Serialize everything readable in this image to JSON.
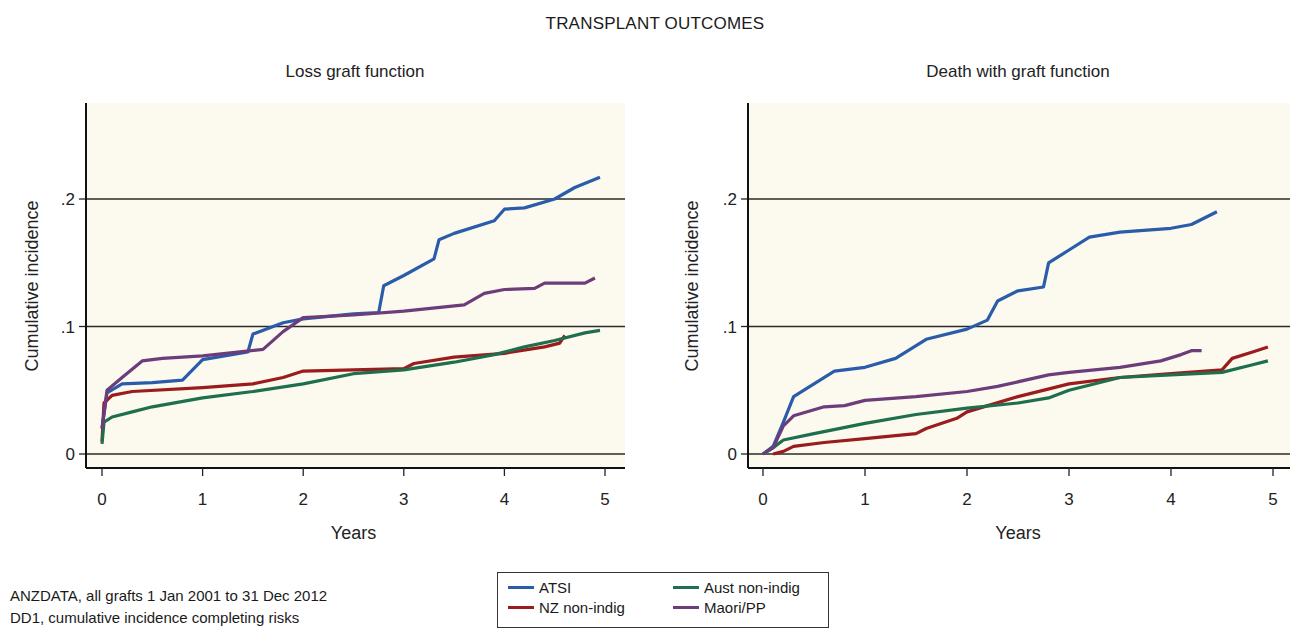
{
  "title": "TRANSPLANT OUTCOMES",
  "caption": {
    "line1": "ANZDATA, all grafts 1 Jan 2001 to 31 Dec 2012",
    "line2": "DD1, cumulative incidence completing risks"
  },
  "legend": [
    {
      "name": "ATSI",
      "color": "#2a5caa"
    },
    {
      "name": "NZ non-indig",
      "color": "#9b1c1c"
    },
    {
      "name": "Aust non-indig",
      "color": "#1f6e4e"
    },
    {
      "name": "Maori/PP",
      "color": "#6c3d7a"
    }
  ],
  "chart_data": [
    {
      "type": "line",
      "title": "Loss graft function",
      "xlabel": "Years",
      "ylabel": "Cumulative incidence",
      "xlim": [
        0,
        5
      ],
      "ylim": [
        0,
        0.25
      ],
      "xticks": [
        "0",
        "1",
        "2",
        "3",
        "4",
        "5"
      ],
      "yticks": [
        "0",
        ".1",
        ".2"
      ],
      "grid": "horizontal at y ticks",
      "series": [
        {
          "name": "ATSI",
          "color": "#2a5caa",
          "x": [
            0,
            0.05,
            0.2,
            0.5,
            0.8,
            1.0,
            1.45,
            1.5,
            1.8,
            2.0,
            2.5,
            2.75,
            2.8,
            3.0,
            3.3,
            3.35,
            3.5,
            3.9,
            4.0,
            4.2,
            4.5,
            4.7,
            4.95
          ],
          "y": [
            0.02,
            0.048,
            0.055,
            0.056,
            0.058,
            0.074,
            0.08,
            0.094,
            0.103,
            0.106,
            0.11,
            0.111,
            0.132,
            0.14,
            0.153,
            0.168,
            0.173,
            0.183,
            0.192,
            0.193,
            0.2,
            0.209,
            0.217
          ]
        },
        {
          "name": "NZ non-indig",
          "color": "#9b1c1c",
          "x": [
            0,
            0.02,
            0.1,
            0.3,
            1.0,
            1.5,
            1.8,
            2.0,
            2.5,
            3.0,
            3.1,
            3.5,
            4.0,
            4.4,
            4.55,
            4.6
          ],
          "y": [
            0.01,
            0.04,
            0.046,
            0.049,
            0.052,
            0.055,
            0.06,
            0.065,
            0.066,
            0.067,
            0.071,
            0.076,
            0.079,
            0.084,
            0.087,
            0.093
          ]
        },
        {
          "name": "Aust non-indig",
          "color": "#1f6e4e",
          "x": [
            0,
            0.02,
            0.1,
            0.3,
            0.5,
            1.0,
            1.5,
            2.0,
            2.5,
            3.0,
            3.5,
            3.9,
            4.2,
            4.5,
            4.8,
            4.95
          ],
          "y": [
            0.008,
            0.025,
            0.029,
            0.033,
            0.037,
            0.044,
            0.049,
            0.055,
            0.063,
            0.066,
            0.072,
            0.078,
            0.084,
            0.089,
            0.095,
            0.097
          ]
        },
        {
          "name": "Maori/PP",
          "color": "#6c3d7a",
          "x": [
            0,
            0.05,
            0.2,
            0.4,
            0.6,
            1.0,
            1.6,
            1.8,
            2.0,
            2.5,
            3.0,
            3.6,
            3.8,
            4.0,
            4.3,
            4.4,
            4.8,
            4.9
          ],
          "y": [
            0.02,
            0.05,
            0.06,
            0.073,
            0.075,
            0.077,
            0.082,
            0.096,
            0.107,
            0.109,
            0.112,
            0.117,
            0.126,
            0.129,
            0.13,
            0.134,
            0.134,
            0.138
          ]
        }
      ]
    },
    {
      "type": "line",
      "title": "Death with graft function",
      "xlabel": "Years",
      "ylabel": "Cumulative incidence",
      "xlim": [
        0,
        5
      ],
      "ylim": [
        0,
        0.25
      ],
      "xticks": [
        "0",
        "1",
        "2",
        "3",
        "4",
        "5"
      ],
      "yticks": [
        "0",
        ".1",
        ".2"
      ],
      "grid": "horizontal at y ticks",
      "series": [
        {
          "name": "ATSI",
          "color": "#2a5caa",
          "x": [
            0,
            0.1,
            0.2,
            0.3,
            0.5,
            0.7,
            1.0,
            1.3,
            1.6,
            2.0,
            2.2,
            2.3,
            2.5,
            2.75,
            2.8,
            3.0,
            3.2,
            3.5,
            4.0,
            4.2,
            4.45
          ],
          "y": [
            0,
            0.006,
            0.025,
            0.045,
            0.055,
            0.065,
            0.068,
            0.075,
            0.09,
            0.098,
            0.105,
            0.12,
            0.128,
            0.131,
            0.15,
            0.16,
            0.17,
            0.174,
            0.177,
            0.18,
            0.19
          ]
        },
        {
          "name": "NZ non-indig",
          "color": "#9b1c1c",
          "x": [
            0.1,
            0.2,
            0.3,
            0.6,
            1.0,
            1.5,
            1.6,
            1.9,
            2.0,
            2.5,
            3.0,
            3.5,
            4.0,
            4.5,
            4.6,
            4.8,
            4.95
          ],
          "y": [
            0,
            0.002,
            0.006,
            0.009,
            0.012,
            0.016,
            0.02,
            0.028,
            0.033,
            0.045,
            0.055,
            0.06,
            0.063,
            0.066,
            0.075,
            0.08,
            0.084
          ]
        },
        {
          "name": "Aust non-indig",
          "color": "#1f6e4e",
          "x": [
            0,
            0.1,
            0.2,
            0.5,
            1.0,
            1.5,
            2.0,
            2.5,
            2.8,
            3.0,
            3.5,
            4.0,
            4.5,
            4.8,
            4.95
          ],
          "y": [
            0,
            0.005,
            0.011,
            0.016,
            0.024,
            0.031,
            0.036,
            0.04,
            0.044,
            0.05,
            0.06,
            0.062,
            0.064,
            0.07,
            0.073
          ]
        },
        {
          "name": "Maori/PP",
          "color": "#6c3d7a",
          "x": [
            0,
            0.1,
            0.2,
            0.3,
            0.6,
            0.8,
            1.0,
            1.5,
            2.0,
            2.3,
            2.8,
            3.0,
            3.5,
            3.9,
            4.1,
            4.2,
            4.3
          ],
          "y": [
            0,
            0.005,
            0.022,
            0.03,
            0.037,
            0.038,
            0.042,
            0.045,
            0.049,
            0.053,
            0.062,
            0.064,
            0.068,
            0.073,
            0.078,
            0.081,
            0.081
          ]
        }
      ]
    }
  ]
}
